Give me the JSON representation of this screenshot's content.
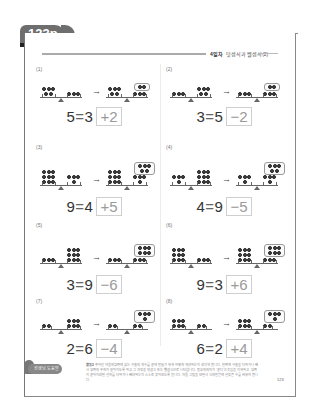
{
  "page_tab": {
    "label": "123p"
  },
  "header": {
    "day_label": "4일차",
    "title": "덧셈식과 뺄셈식(2)"
  },
  "colors": {
    "tab_bg": "#6e6e6e",
    "frame": "#888888",
    "answer_text": "#9a9a9a",
    "answer_border": "#cfcfcf"
  },
  "problems": [
    {
      "num": "(1)",
      "left_start": 5,
      "right_start": 3,
      "left_end": 5,
      "right_end": 3,
      "added_bubble": 2,
      "lhs": "5",
      "rhs": "3",
      "answer": "+2"
    },
    {
      "num": "(2)",
      "left_start": 3,
      "right_start": 5,
      "left_end": 3,
      "right_end": 3,
      "added_bubble": 2,
      "lhs": "3",
      "rhs": "5",
      "answer": "−2"
    },
    {
      "num": "(3)",
      "left_start": 9,
      "right_start": 4,
      "left_end": 9,
      "right_end": 4,
      "added_bubble": 5,
      "lhs": "9",
      "rhs": "4",
      "answer": "+5"
    },
    {
      "num": "(4)",
      "left_start": 4,
      "right_start": 9,
      "left_end": 4,
      "right_end": 4,
      "added_bubble": 5,
      "lhs": "4",
      "rhs": "9",
      "answer": "−5"
    },
    {
      "num": "(5)",
      "left_start": 3,
      "right_start": 9,
      "left_end": 3,
      "right_end": 3,
      "added_bubble": 6,
      "lhs": "3",
      "rhs": "9",
      "answer": "−6"
    },
    {
      "num": "(6)",
      "left_start": 9,
      "right_start": 3,
      "left_end": 9,
      "right_end": 3,
      "added_bubble": 6,
      "lhs": "9",
      "rhs": "3",
      "answer": "+6"
    },
    {
      "num": "(7)",
      "left_start": 2,
      "right_start": 6,
      "left_end": 2,
      "right_end": 2,
      "added_bubble": 4,
      "lhs": "2",
      "rhs": "6",
      "answer": "−4"
    },
    {
      "num": "(8)",
      "left_start": 6,
      "right_start": 2,
      "left_end": 6,
      "right_end": 2,
      "added_bubble": 4,
      "lhs": "6",
      "rhs": "2",
      "answer": "+4"
    }
  ],
  "equals_sign": "=",
  "arrow": "→",
  "footer": {
    "badge_label": "선생님 도움말",
    "note_label": "활동2",
    "note_text": "주어진 저울의 양쪽에 있는 구슬의 개수를 같게 만들기 위해 어떻게 해야 하는지 생각해 봅니다. 한쪽에 구슬을 더하거나 빼서 양쪽의 무게가 같아지도록 하고, 그 과정을 덧셈식 또는 뺄셈식으로 나타냅니다. 등호의 의미가 '같다'는 것임을 이해하고, 양쪽이 같아지려면 얼마를 더하거나 빼야 하는지 스스로 찾아보도록 합니다. 저울 그림을 보면서 식의 빈칸에 알맞은 수를 써넣어 봅니다.",
    "page_number": "123"
  }
}
